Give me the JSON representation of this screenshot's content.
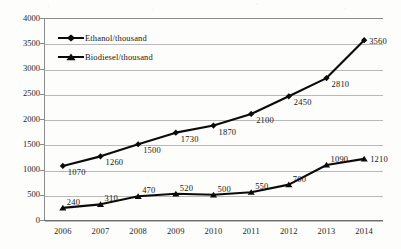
{
  "chart_data": {
    "type": "line",
    "title": "",
    "xlabel": "",
    "ylabel": "",
    "categories": [
      "2006",
      "2007",
      "2008",
      "2009",
      "2010",
      "2011",
      "2012",
      "2013",
      "2014"
    ],
    "ylim": [
      0,
      4000
    ],
    "yticks": [
      0,
      500,
      1000,
      1500,
      2000,
      2500,
      3000,
      3500,
      4000
    ],
    "grid": "horizontal",
    "legend_position": "top-left-inside",
    "series": [
      {
        "name": "Ethanol/thousand",
        "marker": "diamond",
        "values": [
          1070,
          1260,
          1500,
          1730,
          1870,
          2100,
          2450,
          2810,
          3560
        ],
        "labels": [
          "1070",
          "1260",
          "1500",
          "1730",
          "1870",
          "2100",
          "2450",
          "2810",
          "3560"
        ]
      },
      {
        "name": "Biodiesel/thousand",
        "marker": "triangle",
        "values": [
          240,
          310,
          470,
          520,
          500,
          550,
          700,
          1090,
          1210
        ],
        "labels": [
          "240",
          "310",
          "470",
          "520",
          "500",
          "550",
          "700",
          "1090",
          "1210"
        ]
      }
    ],
    "colors": {
      "series_line": "#0b0b0b",
      "gridline": "#b9b9b9",
      "axis": "#8c8c8c",
      "background": "#fdfdfb",
      "text": "#1a1a1a"
    }
  }
}
